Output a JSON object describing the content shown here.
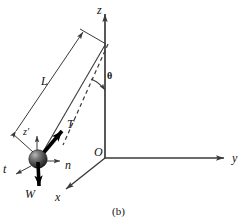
{
  "figure": {
    "caption": "(b)",
    "background_color": "#ffffff",
    "line_color": "#3a3a3a",
    "vector_color": "#000000",
    "text_color": "#111111",
    "width": 247,
    "height": 223
  },
  "axes": {
    "origin_label": "O",
    "z_label": "z",
    "y_label": "y",
    "x_label": "x",
    "origin": {
      "x": 105,
      "y": 158
    },
    "z_tip": {
      "x": 105,
      "y": 10
    },
    "y_tip": {
      "x": 228,
      "y": 158
    },
    "x_tip": {
      "x": 62,
      "y": 192
    }
  },
  "pendulum": {
    "length_label": "L",
    "angle_label": "θ",
    "pivot": {
      "x": 105,
      "y": 45
    },
    "bob": {
      "x": 38,
      "y": 159,
      "radius": 9
    },
    "string_note": "cord from pivot on z-axis to bob",
    "dashed_note": "dashed reference line from pivot showing theta from z-axis"
  },
  "vectors": [
    {
      "name": "tension",
      "label": "T",
      "style": "thick",
      "from": {
        "x": 38,
        "y": 159
      },
      "to": {
        "x": 65,
        "y": 128
      },
      "label_pos": {
        "x": 68,
        "y": 120
      }
    },
    {
      "name": "weight",
      "label": "W",
      "style": "thick",
      "from": {
        "x": 38,
        "y": 159
      },
      "to": {
        "x": 39,
        "y": 192
      },
      "label_pos": {
        "x": 26,
        "y": 192
      }
    },
    {
      "name": "normal-axis",
      "label": "n",
      "style": "thin",
      "from": {
        "x": 45,
        "y": 161
      },
      "to": {
        "x": 64,
        "y": 161
      },
      "label_pos": {
        "x": 66,
        "y": 163
      }
    },
    {
      "name": "tangential-axis",
      "label": "t",
      "style": "thin",
      "from": {
        "x": 31,
        "y": 165
      },
      "to": {
        "x": 13,
        "y": 175
      },
      "label_pos": {
        "x": 3,
        "y": 166
      }
    },
    {
      "name": "local-z-axis",
      "label": "z′",
      "style": "thin",
      "from": {
        "x": 37,
        "y": 152
      },
      "to": {
        "x": 37,
        "y": 133
      },
      "label_pos": {
        "x": 24,
        "y": 128
      }
    }
  ]
}
